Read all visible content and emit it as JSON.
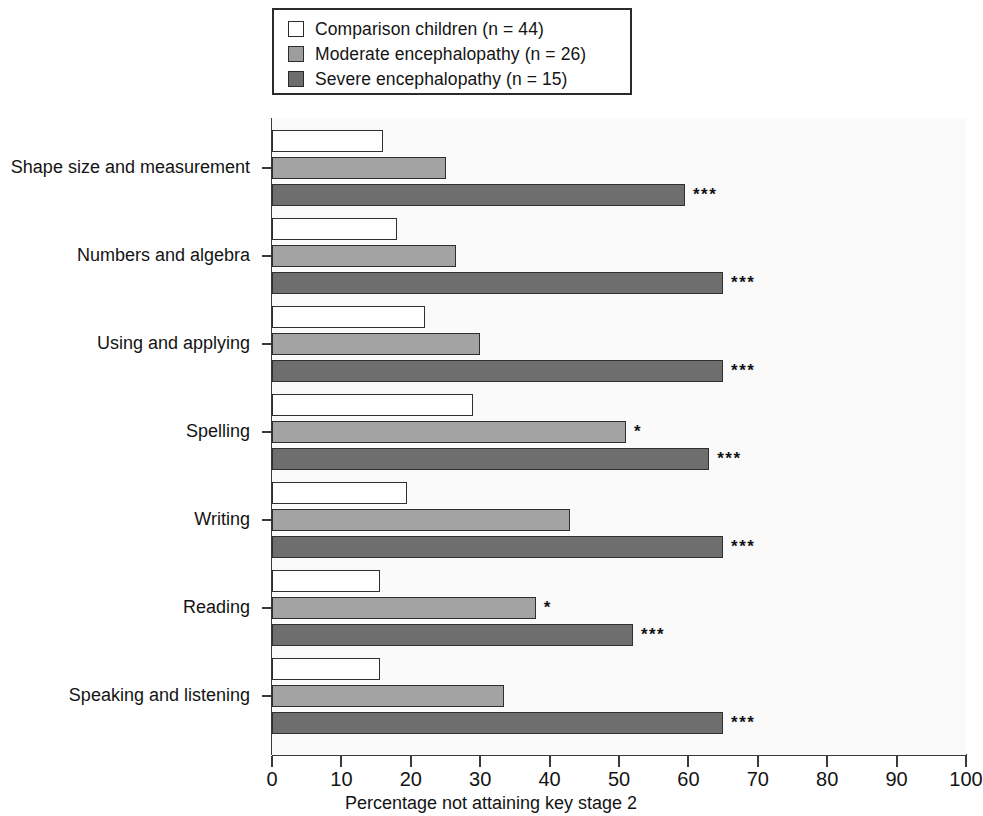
{
  "chart_data": {
    "type": "bar",
    "orientation": "horizontal",
    "title": "",
    "xlabel": "Percentage not attaining key stage 2",
    "ylabel": "",
    "xlim": [
      0,
      100
    ],
    "xticks": [
      0,
      10,
      20,
      30,
      40,
      50,
      60,
      70,
      80,
      90,
      100
    ],
    "grid": false,
    "legend_position": "top",
    "categories": [
      "Shape size and measurement",
      "Numbers and algebra",
      "Using and applying",
      "Spelling",
      "Writing",
      "Reading",
      "Speaking and listening"
    ],
    "series": [
      {
        "name": "Comparison children (n = 44)",
        "color": "#ffffff",
        "values": [
          16,
          18,
          22,
          29,
          19.5,
          15.5,
          15.5
        ],
        "significance": [
          "",
          "",
          "",
          "",
          "",
          "",
          ""
        ]
      },
      {
        "name": "Moderate encephalopathy (n = 26)",
        "color": "#a3a3a3",
        "values": [
          25,
          26.5,
          30,
          51,
          43,
          38,
          33.5
        ],
        "significance": [
          "",
          "",
          "",
          "*",
          "",
          "*",
          ""
        ]
      },
      {
        "name": "Severe encephalopathy (n = 15)",
        "color": "#6e6e6e",
        "values": [
          59.5,
          65,
          65,
          63,
          65,
          52,
          65
        ],
        "significance": [
          "***",
          "***",
          "***",
          "***",
          "***",
          "***",
          "***"
        ]
      }
    ]
  },
  "legend": {
    "items": [
      {
        "label": "Comparison children (n = 44)",
        "swatch": "comparison"
      },
      {
        "label": "Moderate encephalopathy (n = 26)",
        "swatch": "moderate"
      },
      {
        "label": "Severe encephalopathy (n = 15)",
        "swatch": "severe"
      }
    ]
  },
  "axis": {
    "x_title": "Percentage not attaining key stage 2",
    "x_tick_labels": [
      "0",
      "10",
      "20",
      "30",
      "40",
      "50",
      "60",
      "70",
      "80",
      "90",
      "100"
    ],
    "y_tick_labels": [
      "Shape size and measurement",
      "Numbers and algebra",
      "Using and applying",
      "Spelling",
      "Writing",
      "Reading",
      "Speaking and listening"
    ]
  }
}
